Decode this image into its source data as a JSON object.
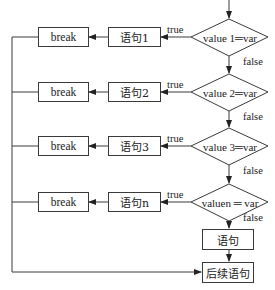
{
  "diagram": {
    "type": "switch-case flowchart",
    "cases": [
      {
        "condition": "value 1═var",
        "statement": "语句1",
        "break_label": "break",
        "true_label": "true",
        "false_label": "false"
      },
      {
        "condition": "value 2═var",
        "statement": "语句2",
        "break_label": "break",
        "true_label": "true",
        "false_label": "false"
      },
      {
        "condition": "value 3═var",
        "statement": "语句3",
        "break_label": "break",
        "true_label": "true",
        "false_label": "false"
      },
      {
        "condition": "valuen ═ var",
        "statement": "语句n",
        "break_label": "break",
        "true_label": "true",
        "false_label": "false"
      }
    ],
    "default_statement": "语句",
    "next_statement": "后续语句",
    "colors": {
      "line": "#3a3a3a",
      "text": "#222222",
      "background": "#ffffff"
    }
  }
}
